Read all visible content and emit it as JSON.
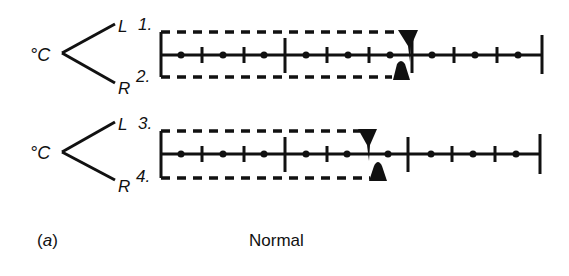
{
  "diagram": {
    "caption_label": "(a)",
    "caption_letter": "a",
    "caption_title": "Normal",
    "ink_color": "#111111",
    "background": "#ffffff",
    "rows": [
      {
        "unit": "°C",
        "top_label": "L",
        "top_number": "1.",
        "bottom_label": "R",
        "bottom_number": "2.",
        "left_marker_position": "just past 2nd major tick",
        "right_marker_position": "just before 2nd major tick"
      },
      {
        "unit": "°C",
        "top_label": "L",
        "top_number": "3.",
        "bottom_label": "R",
        "bottom_number": "4.",
        "left_marker_position": "before 2nd major tick",
        "right_marker_position": "before 2nd major tick"
      }
    ]
  }
}
